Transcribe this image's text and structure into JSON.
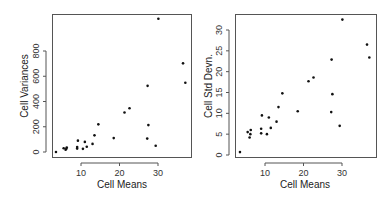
{
  "chart_data": [
    {
      "type": "scatter",
      "title": "",
      "xlabel": "Cell Means",
      "ylabel": "Cell Variances",
      "xlim": [
        2,
        38
      ],
      "ylim": [
        -30,
        1080
      ],
      "xticks": [
        10,
        20,
        30
      ],
      "yticks": [
        0,
        200,
        400,
        600,
        800
      ],
      "grid": false,
      "legend": null,
      "x": [
        3.5,
        5.5,
        6.0,
        6.2,
        6.3,
        9.0,
        9.0,
        9.2,
        10.5,
        11.0,
        11.5,
        13.0,
        13.5,
        14.5,
        18.5,
        21.3,
        22.6,
        27.2,
        27.3,
        27.5,
        29.4,
        30.1,
        36.5,
        37.1
      ],
      "y": [
        0,
        30,
        18,
        25,
        36,
        27,
        40,
        90,
        25,
        80,
        42,
        64,
        132,
        219,
        110,
        313,
        346,
        106,
        524,
        213,
        49,
        1056,
        702,
        548
      ]
    },
    {
      "type": "scatter",
      "title": "",
      "xlabel": "Cell Means",
      "ylabel": "Cell Std Devn.",
      "xlim": [
        2,
        38
      ],
      "ylim": [
        -1,
        34
      ],
      "xticks": [
        10,
        20,
        30
      ],
      "yticks": [
        0,
        5,
        10,
        15,
        20,
        25,
        30
      ],
      "grid": false,
      "legend": null,
      "x": [
        3.5,
        5.5,
        6.0,
        6.2,
        6.3,
        9.0,
        9.0,
        9.2,
        10.5,
        11.0,
        11.5,
        13.0,
        13.5,
        14.5,
        18.5,
        21.3,
        22.6,
        27.2,
        27.3,
        27.5,
        29.4,
        30.1,
        36.5,
        37.1
      ],
      "y": [
        0.7,
        5.5,
        4.2,
        5.0,
        6.0,
        5.2,
        6.3,
        9.5,
        5.0,
        9.0,
        6.5,
        8.0,
        11.5,
        14.8,
        10.5,
        17.7,
        18.6,
        10.3,
        22.9,
        14.6,
        7.0,
        32.5,
        26.5,
        23.4
      ]
    }
  ],
  "left_plot": {
    "xlabel": "Cell Means",
    "ylabel": "Cell Variances"
  },
  "right_plot": {
    "xlabel": "Cell Means",
    "ylabel": "Cell Std Devn."
  }
}
